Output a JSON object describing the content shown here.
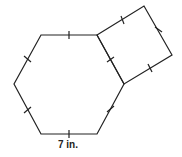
{
  "diagram": {
    "shapes": [
      {
        "type": "hexagon",
        "vertices": [
          [
            41,
            35
          ],
          [
            97,
            35
          ],
          [
            124,
            84
          ],
          [
            97,
            134
          ],
          [
            41,
            134
          ],
          [
            14,
            84
          ]
        ],
        "equal_sides": true
      },
      {
        "type": "square",
        "vertices": [
          [
            97,
            35
          ],
          [
            144,
            6
          ],
          [
            172,
            55
          ],
          [
            124,
            84
          ]
        ],
        "equal_sides": true
      }
    ],
    "label": "7 in.",
    "stroke_color": "#222222"
  }
}
